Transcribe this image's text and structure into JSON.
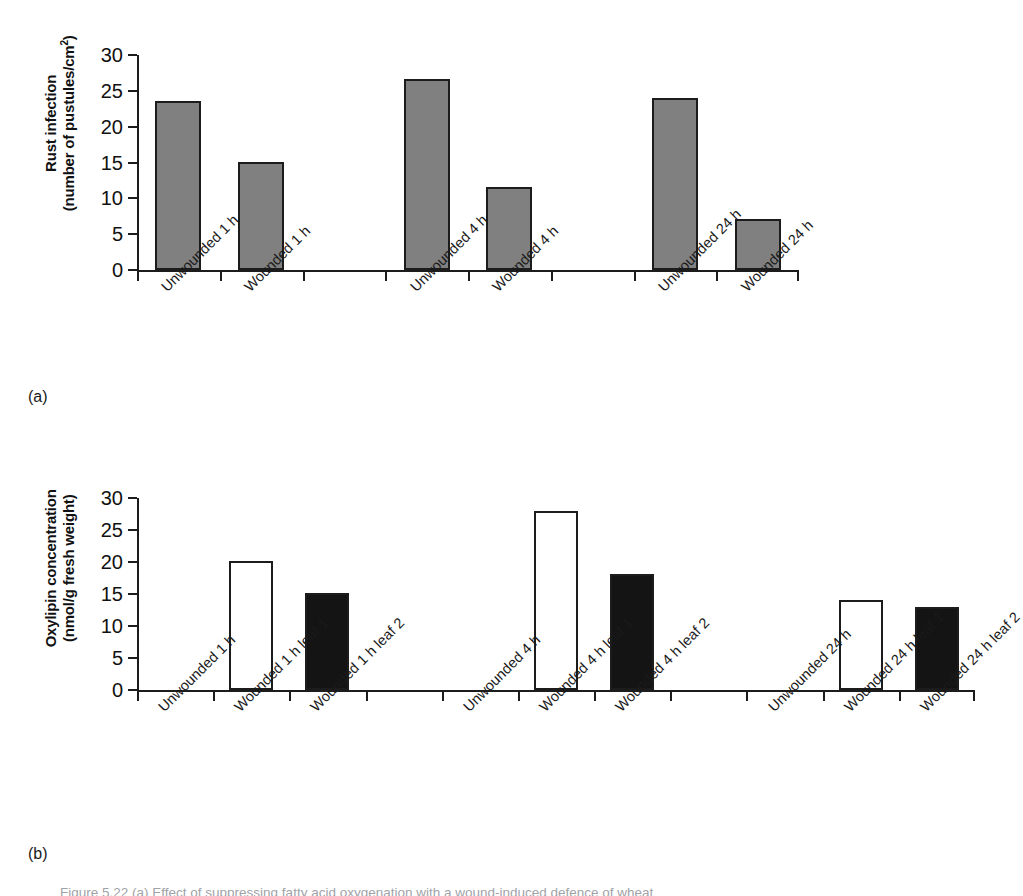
{
  "figure": {
    "caption": "Figure 5.22 (a) Effect of suppressing fatty acid oxygenation with a wound-induced defence of wheat",
    "panel_a_marker": "(a)",
    "panel_b_marker": "(b)"
  },
  "chart_data": [
    {
      "type": "bar",
      "panel": "(a)",
      "title": "",
      "xlabel": "",
      "ylabel": "Rust infection (number of pustules/cm2)",
      "ylabel_line1": "Rust infection",
      "ylabel_line2": "(number of pustules/cm",
      "ylabel_line2_sup": "2",
      "ylabel_line2_end": ")",
      "ylim": [
        0,
        30
      ],
      "yticks": [
        0,
        5,
        10,
        15,
        20,
        25,
        30
      ],
      "ytick_labels": [
        "0",
        "5",
        "10",
        "15",
        "20",
        "25",
        "30"
      ],
      "grid": false,
      "legend": "none",
      "bar_color": "#808080",
      "categories": [
        "Unwounded 1 h",
        "Wounded 1 h",
        "Unwounded 4 h",
        "Wounded 4 h",
        "Unwounded 24 h",
        "Wounded 24 h"
      ],
      "values": [
        23.6,
        15.1,
        26.6,
        11.6,
        24.0,
        7.1
      ],
      "bars": [
        {
          "label": "Unwounded 1 h",
          "value": 23.6,
          "slot": 0,
          "fill": "gray"
        },
        {
          "label": "Wounded 1 h",
          "value": 15.1,
          "slot": 1,
          "fill": "gray"
        },
        {
          "label": "Unwounded 4 h",
          "value": 26.6,
          "slot": 3,
          "fill": "gray"
        },
        {
          "label": "Wounded 4 h",
          "value": 11.6,
          "slot": 4,
          "fill": "gray"
        },
        {
          "label": "Unwounded 24 h",
          "value": 24.0,
          "slot": 6,
          "fill": "gray"
        },
        {
          "label": "Wounded 24 h",
          "value": 7.1,
          "slot": 7,
          "fill": "gray"
        }
      ]
    },
    {
      "type": "bar",
      "panel": "(b)",
      "title": "",
      "xlabel": "",
      "ylabel": "Oxylipin concentration (nmol/g fresh weight)",
      "ylabel_line1": "Oxylipin concentration",
      "ylabel_line2": "(nmol/g fresh weight)",
      "ylim": [
        0,
        30
      ],
      "yticks": [
        0,
        5,
        10,
        15,
        20,
        25,
        30
      ],
      "ytick_labels": [
        "0",
        "5",
        "10",
        "15",
        "20",
        "25",
        "30"
      ],
      "grid": false,
      "legend": "none",
      "bar_color_leaf1": "#ffffff",
      "bar_color_leaf2": "#141414",
      "categories": [
        "Unwounded 1 h",
        "Wounded 1 h leaf 1",
        "Wounded 1 h leaf 2",
        "Unwounded 4 h",
        "Wounded 4 h leaf 1",
        "Wounded 4 h leaf 2",
        "Unwounded 24 h",
        "Wounded 24 h leaf 1",
        "Wounded 24 h leaf 2"
      ],
      "values": [
        0,
        20.1,
        15.1,
        0,
        28.0,
        18.1,
        0,
        14.0,
        13.0
      ],
      "bars": [
        {
          "label": "Unwounded 1 h",
          "value": 0,
          "slot": 0,
          "fill": "none"
        },
        {
          "label": "Wounded 1 h leaf 1",
          "value": 20.1,
          "slot": 1,
          "fill": "white"
        },
        {
          "label": "Wounded 1 h leaf 2",
          "value": 15.1,
          "slot": 2,
          "fill": "black"
        },
        {
          "label": "Unwounded 4 h",
          "value": 0,
          "slot": 4,
          "fill": "none"
        },
        {
          "label": "Wounded 4 h leaf 1",
          "value": 28.0,
          "slot": 5,
          "fill": "white"
        },
        {
          "label": "Wounded 4 h leaf 2",
          "value": 18.1,
          "slot": 6,
          "fill": "black"
        },
        {
          "label": "Unwounded 24 h",
          "value": 0,
          "slot": 8,
          "fill": "none"
        },
        {
          "label": "Wounded 24 h leaf 1",
          "value": 14.0,
          "slot": 9,
          "fill": "white"
        },
        {
          "label": "Wounded 24 h leaf 2",
          "value": 13.0,
          "slot": 10,
          "fill": "black"
        }
      ]
    }
  ]
}
